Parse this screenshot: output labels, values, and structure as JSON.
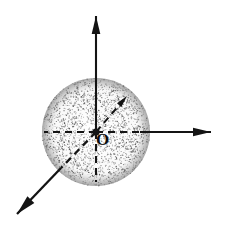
{
  "figure": {
    "background_color": "#ffffff",
    "ink_color": "#141414",
    "width": 225,
    "height": 232,
    "origin_label": "O",
    "origin_label_color": "#0d0d0d",
    "sphere": {
      "name": "stippled-sphere",
      "center_x": 96,
      "center_y": 132,
      "radius": 54,
      "fill_description": "random stipple / speckle texture",
      "stipple_color": "#4a4a4a",
      "edge_color": "#6e6e6e",
      "dot_count": 2600
    },
    "origin_marker": {
      "name": "origin-point",
      "x": 96,
      "y": 132,
      "radius": 3.6,
      "color": "#141414"
    },
    "axes": [
      {
        "name": "vertical-axis",
        "label": "",
        "direction": "up",
        "style_outside_sphere": "solid",
        "style_inside_sphere": "solid",
        "from_x": 96,
        "from_y": 132,
        "to_x": 96,
        "to_y": 16,
        "arrowhead": true,
        "arrow_size": 9,
        "stroke_width": 2.1
      },
      {
        "name": "horizontal-axis",
        "label": "",
        "direction": "right",
        "style_outside_sphere": "solid",
        "style_inside_sphere": "dashed",
        "from_x": 96,
        "from_y": 132,
        "to_x": 211,
        "to_y": 132,
        "solid_start_x": 140,
        "arrowhead": true,
        "arrow_size": 9,
        "stroke_width": 2.1
      },
      {
        "name": "diagonal-axis-front-left",
        "label": "",
        "direction": "down-left",
        "style_outside_sphere": "solid",
        "style_inside_sphere": "dashed",
        "from_x": 96,
        "from_y": 132,
        "to_x": 17,
        "to_y": 214,
        "solid_start_x": 61,
        "solid_start_y": 168,
        "arrowhead": true,
        "arrow_size": 10,
        "stroke_width": 2.3
      },
      {
        "name": "horizontal-axis-negative-stub",
        "label": "",
        "direction": "left",
        "style_outside_sphere": "none",
        "style_inside_sphere": "dashed",
        "from_x": 96,
        "from_y": 132,
        "to_x": 44,
        "to_y": 132,
        "arrowhead": false,
        "stroke_width": 2.1
      },
      {
        "name": "vertical-axis-negative-stub",
        "label": "",
        "direction": "down",
        "style_outside_sphere": "none",
        "style_inside_sphere": "dashed",
        "from_x": 96,
        "from_y": 132,
        "to_x": 96,
        "to_y": 182,
        "arrowhead": false,
        "stroke_width": 2.1
      },
      {
        "name": "diagonal-axis-back-right",
        "label": "",
        "direction": "up-right",
        "style_outside_sphere": "none",
        "style_inside_sphere": "dashed",
        "from_x": 96,
        "from_y": 132,
        "to_x": 127,
        "to_y": 96,
        "arrowhead": true,
        "arrow_size": 6,
        "stroke_width": 2.0
      }
    ]
  }
}
